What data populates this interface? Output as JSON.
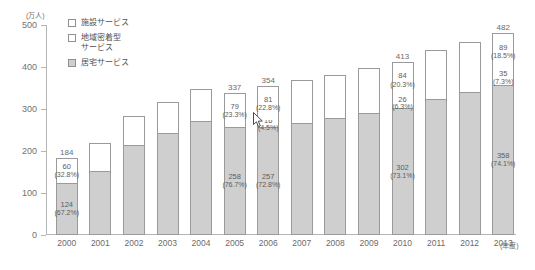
{
  "chart_data": {
    "type": "bar",
    "stacked": true,
    "title": "",
    "xlabel": "年度",
    "ylabel": "万人",
    "ylim": [
      0,
      500
    ],
    "yticks": [
      0,
      100,
      200,
      300,
      400,
      500
    ],
    "grid": false,
    "legend_position": "top-left",
    "categories": [
      "2000",
      "2001",
      "2002",
      "2003",
      "2004",
      "2005",
      "2006",
      "2007",
      "2008",
      "2009",
      "2010",
      "2011",
      "2012",
      "2013"
    ],
    "series": [
      {
        "name": "居宅サービス",
        "key": "home",
        "color": "#cfcfcf",
        "values": [
          124,
          153,
          214,
          243,
          271,
          258,
          257,
          267,
          278,
          290,
          302,
          325,
          340,
          358
        ]
      },
      {
        "name": "地域密着型サービス",
        "key": "community",
        "color": "#ffffff",
        "values": [
          0,
          0,
          0,
          0,
          0,
          0,
          16,
          19,
          21,
          24,
          26,
          29,
          32,
          35
        ]
      },
      {
        "name": "施設サービス",
        "key": "facility",
        "color": "#ffffff",
        "values": [
          60,
          65,
          70,
          74,
          77,
          79,
          81,
          82,
          83,
          84,
          84,
          86,
          87,
          89
        ]
      }
    ],
    "totals": [
      184,
      218,
      284,
      317,
      348,
      337,
      354,
      368,
      382,
      398,
      413,
      440,
      459,
      482
    ],
    "labeled_totals": {
      "2000": "184",
      "2005": "337",
      "2006": "354",
      "2010": "413",
      "2013": "482"
    },
    "data_labels": [
      {
        "year": "2000",
        "facility_value": "60",
        "facility_pct": "(32.8%)",
        "community_value": "",
        "community_pct": "",
        "home_value": "124",
        "home_pct": "(67.2%)"
      },
      {
        "year": "2005",
        "facility_value": "79",
        "facility_pct": "(23.3%)",
        "community_value": "",
        "community_pct": "",
        "home_value": "258",
        "home_pct": "(76.7%)"
      },
      {
        "year": "2006",
        "facility_value": "81",
        "facility_pct": "(22.8%)",
        "community_value": "16",
        "community_pct": "(4.5%)",
        "home_value": "257",
        "home_pct": "(72.8%)"
      },
      {
        "year": "2010",
        "facility_value": "84",
        "facility_pct": "(20.3%)",
        "community_value": "26",
        "community_pct": "(6.3%)",
        "home_value": "302",
        "home_pct": "(73.1%)"
      },
      {
        "year": "2013",
        "facility_value": "89",
        "facility_pct": "(18.5%)",
        "community_value": "35",
        "community_pct": "(7.3%)",
        "home_value": "358",
        "home_pct": "(74.1%)"
      }
    ]
  },
  "axis": {
    "unit_label": "(万人)",
    "x_unit_label": "(年度)",
    "ticks": [
      "500",
      "400",
      "300",
      "200",
      "100",
      "0"
    ]
  },
  "legend": {
    "items": [
      {
        "label": "施設サービス",
        "swatch": "open"
      },
      {
        "label": "地域密着型\nサービス",
        "swatch": "open"
      },
      {
        "label": "居宅サービス",
        "swatch": "filled"
      }
    ]
  },
  "colors": {
    "home_fill": "#cfcfcf",
    "open_fill": "#ffffff",
    "stroke": "#9a9a9a",
    "axis": "#b5b5b5",
    "text": "#6b6b6b"
  }
}
